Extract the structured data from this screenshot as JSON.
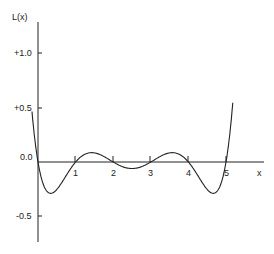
{
  "chart_data": {
    "type": "line",
    "title": "",
    "xlabel": "x",
    "ylabel": "L(x)",
    "xlim": [
      0,
      6
    ],
    "ylim": [
      -0.75,
      1.3
    ],
    "x_ticks": [
      "1",
      "2",
      "3",
      "4",
      "5"
    ],
    "y_ticks": [
      "+1.0",
      "+0.5",
      "0.0",
      "-0.5"
    ],
    "grid": false,
    "legend": null,
    "series": [
      {
        "name": "L(x)",
        "x": [
          -0.15,
          0,
          0.32,
          1,
          1.5,
          2,
          2.5,
          3,
          3.5,
          4,
          4.68,
          5,
          5.2
        ],
        "values": [
          0.57,
          0.0,
          -0.29,
          0.0,
          0.085,
          0.0,
          -0.06,
          0.0,
          0.085,
          0.0,
          -0.29,
          0.0,
          0.6
        ]
      }
    ],
    "roots": [
      0,
      1,
      2,
      3,
      4,
      5
    ]
  }
}
